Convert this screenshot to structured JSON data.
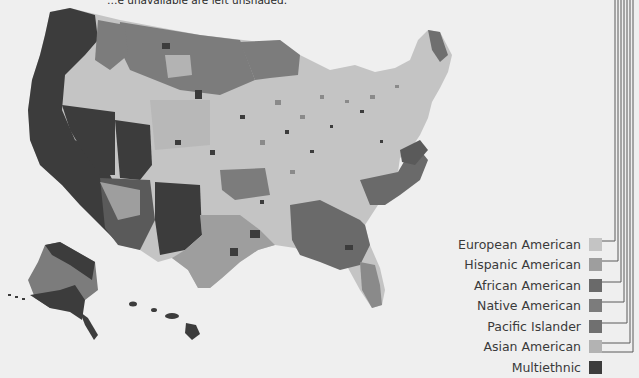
{
  "caption": {
    "text": "…e unavailable are left unshaded."
  },
  "map": {
    "subject": "United States counties shaded by largest ethnic group",
    "regions_visible": [
      "Contiguous United States",
      "Alaska",
      "Hawaii"
    ],
    "unshaded_color": "#efefef"
  },
  "legend": {
    "items": [
      {
        "label": "European American",
        "color": "#c4c4c4"
      },
      {
        "label": "Hispanic American",
        "color": "#9e9e9e"
      },
      {
        "label": "African American",
        "color": "#6a6a6a"
      },
      {
        "label": "Native American",
        "color": "#7c7c7c"
      },
      {
        "label": "Pacific Islander",
        "color": "#707070"
      },
      {
        "label": "Asian American",
        "color": "#b3b3b3"
      },
      {
        "label": "Multiethnic",
        "color": "#3c3c3c"
      }
    ]
  }
}
